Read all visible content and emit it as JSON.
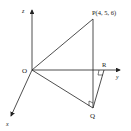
{
  "diagram": {
    "points": {
      "O": {
        "label": "O"
      },
      "P": {
        "label": "P(4, 5, 6)"
      },
      "Q": {
        "label": "Q"
      },
      "R": {
        "label": "R"
      }
    },
    "axes": {
      "z": {
        "label": "z"
      },
      "y": {
        "label": "y"
      },
      "x": {
        "label": "x"
      }
    },
    "colors": {
      "stroke": "#222222",
      "background": "#ffffff"
    }
  }
}
